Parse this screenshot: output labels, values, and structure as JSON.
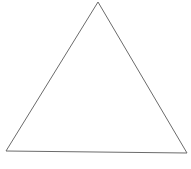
{
  "diagram": {
    "shape": "triangle",
    "vertices": {
      "apex": [
        98,
        2
      ],
      "bottom_left": [
        6,
        151
      ],
      "bottom_right": [
        187,
        153
      ]
    },
    "stroke_color": "#6b6b6b",
    "stroke_width": 1,
    "fill_color": "none",
    "background_color": "#ffffff"
  }
}
